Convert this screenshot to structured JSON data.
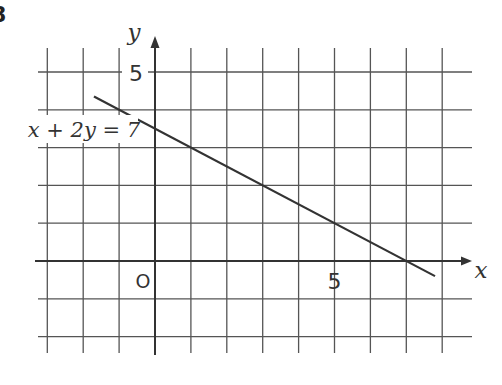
{
  "question_number": "8",
  "chart_data": {
    "type": "line",
    "title": "",
    "equation_label": "x + 2y = 7",
    "xlabel": "x",
    "ylabel": "y",
    "origin_label": "O",
    "x_tick_labels": [
      {
        "value": 5,
        "label": "5"
      }
    ],
    "y_tick_labels": [
      {
        "value": 5,
        "label": "5"
      }
    ],
    "xlim": [
      -3.3,
      8.8
    ],
    "ylim": [
      -2.5,
      5.8
    ],
    "grid": true,
    "grid_x_values": [
      -3,
      -2,
      -1,
      0,
      1,
      2,
      3,
      4,
      5,
      6,
      7,
      8
    ],
    "grid_y_values": [
      -2,
      -1,
      0,
      1,
      2,
      3,
      4,
      5
    ],
    "series": [
      {
        "name": "x + 2y = 7",
        "x": [
          -1.7,
          7.8
        ],
        "y": [
          4.35,
          -0.4
        ],
        "intercepts": {
          "x_intercept": 7,
          "y_intercept": 3.5
        },
        "points_on_grid": [
          [
            -1,
            4
          ],
          [
            1,
            3
          ],
          [
            3,
            2
          ],
          [
            5,
            1
          ],
          [
            7,
            0
          ]
        ]
      }
    ],
    "colors": {
      "grid": "#555555",
      "axis": "#333333",
      "line": "#333333",
      "text": "#333333"
    }
  }
}
